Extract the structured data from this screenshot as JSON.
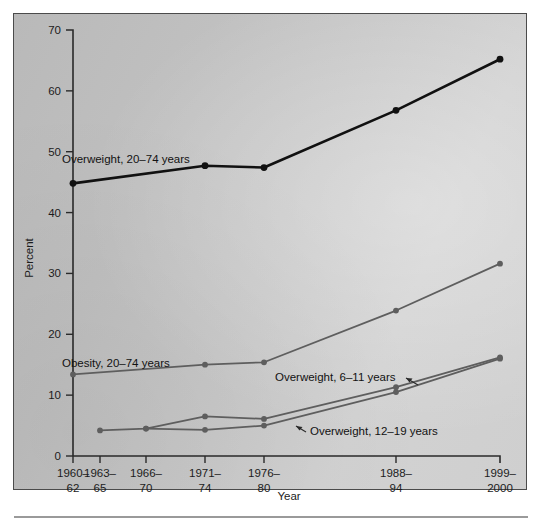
{
  "figure": {
    "background_color": "#c6c6c6",
    "frame_color": "#4b4b4b",
    "axis_color": "#2a2a2a"
  },
  "axes": {
    "x_title": "Year",
    "y_title": "Percent",
    "y_ticks": [
      "0",
      "10",
      "20",
      "30",
      "40",
      "50",
      "60",
      "70"
    ],
    "x_tick_lines": [
      {
        "top": "1960–",
        "bottom": "62"
      },
      {
        "top": "1963–",
        "bottom": "65"
      },
      {
        "top": "1966–",
        "bottom": "70"
      },
      {
        "top": "1971–",
        "bottom": "74"
      },
      {
        "top": "1976–",
        "bottom": "80"
      },
      {
        "top": "1988–",
        "bottom": "94"
      },
      {
        "top": "1999–",
        "bottom": "2000"
      }
    ]
  },
  "labels": {
    "overweight_adults": "Overweight, 20–74 years",
    "obesity_adults": "Obesity, 20–74 years",
    "overweight_6_11": "Overweight, 6–11 years",
    "overweight_12_19": "Overweight, 12–19 years"
  },
  "chart_data": {
    "type": "line",
    "title": "",
    "xlabel": "Year",
    "ylabel": "Percent",
    "ylim": [
      0,
      70
    ],
    "grid": false,
    "legend_position": "inline-annotations",
    "categories": [
      "1960–62",
      "1963–65",
      "1966–70",
      "1971–74",
      "1976–80",
      "1988–94",
      "1999–2000"
    ],
    "series": [
      {
        "name": "Overweight, 20–74 years",
        "color": "#111111",
        "line_width": 2.6,
        "marker": "circle",
        "x": [
          "1960–62",
          "1971–74",
          "1976–80",
          "1988–94",
          "1999–2000"
        ],
        "values": [
          44.8,
          47.7,
          47.4,
          56.8,
          65.2
        ]
      },
      {
        "name": "Obesity, 20–74 years",
        "color": "#5e5e5e",
        "line_width": 1.8,
        "marker": "circle",
        "x": [
          "1960–62",
          "1971–74",
          "1976–80",
          "1988–94",
          "1999–2000"
        ],
        "values": [
          13.4,
          15.0,
          15.4,
          23.9,
          31.6
        ]
      },
      {
        "name": "Overweight, 6–11 years",
        "color": "#5e5e5e",
        "line_width": 1.8,
        "marker": "circle",
        "x": [
          "1963–65",
          "1966–70",
          "1971–74",
          "1976–80",
          "1988–94",
          "1999–2000"
        ],
        "values": [
          4.2,
          4.5,
          6.5,
          6.1,
          11.3,
          16.2
        ]
      },
      {
        "name": "Overweight, 12–19 years",
        "color": "#5e5e5e",
        "line_width": 1.8,
        "marker": "circle",
        "x": [
          "1966–70",
          "1971–74",
          "1976–80",
          "1988–94",
          "1999–2000"
        ],
        "values": [
          4.5,
          4.3,
          5.0,
          10.5,
          16.0
        ]
      }
    ]
  }
}
